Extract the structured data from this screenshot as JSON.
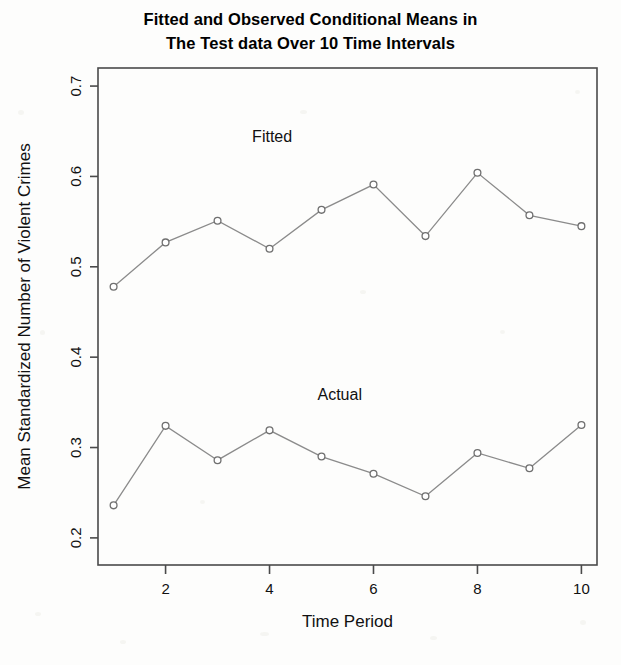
{
  "figure": {
    "title_line1": "Fitted and Observed Conditional Means in",
    "title_line2": "The Test data Over 10 Time Intervals"
  },
  "chart_data": {
    "type": "line",
    "title": "Fitted and Observed Conditional Means in The Test data Over 10 Time Intervals",
    "xlabel": "Time Period",
    "ylabel": "Mean Standardized Number of Violent Crimes",
    "x": [
      1,
      2,
      3,
      4,
      5,
      6,
      7,
      8,
      9,
      10
    ],
    "xlim": [
      0.7,
      10.3
    ],
    "ylim": [
      0.17,
      0.72
    ],
    "xticks": [
      2,
      4,
      6,
      8,
      10
    ],
    "xtick_labels": [
      "2",
      "4",
      "6",
      "8",
      "10"
    ],
    "yticks": [
      0.2,
      0.3,
      0.4,
      0.5,
      0.6,
      0.7
    ],
    "ytick_labels": [
      "0.2",
      "0.3",
      "0.4",
      "0.5",
      "0.6",
      "0.7"
    ],
    "grid": false,
    "legend": "inline-annotations",
    "marker": "open-circle",
    "line_color": "#8b8b8b",
    "marker_edge_color": "#6f6f6f",
    "marker_face_color": "#ffffff",
    "series": [
      {
        "name": "Fitted",
        "annotation": "Fitted",
        "values": [
          0.478,
          0.527,
          0.551,
          0.52,
          0.563,
          0.591,
          0.534,
          0.604,
          0.557,
          0.545
        ]
      },
      {
        "name": "Actual",
        "annotation": "Actual",
        "values": [
          0.236,
          0.324,
          0.286,
          0.319,
          0.29,
          0.271,
          0.246,
          0.294,
          0.277,
          0.325
        ]
      }
    ],
    "annotations": [
      {
        "text": "Fitted",
        "x": 4.05,
        "y": 0.638
      },
      {
        "text": "Actual",
        "x": 5.35,
        "y": 0.353
      }
    ]
  }
}
